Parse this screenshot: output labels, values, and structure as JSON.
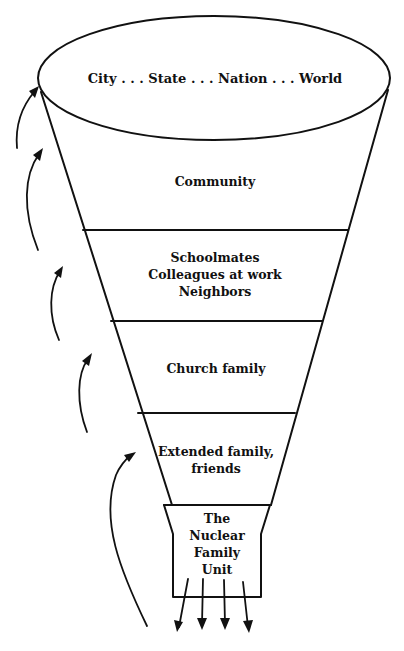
{
  "diagram": {
    "top_level": {
      "label": "City . . . State . . . Nation . . . World"
    },
    "levels": [
      {
        "id": "community",
        "lines": [
          "Community"
        ]
      },
      {
        "id": "schoolmates",
        "lines": [
          "Schoolmates",
          "Colleagues at work",
          "Neighbors"
        ]
      },
      {
        "id": "church",
        "lines": [
          "Church family"
        ]
      },
      {
        "id": "extended",
        "lines": [
          "Extended family,",
          "friends"
        ]
      },
      {
        "id": "nuclear",
        "lines": [
          "The",
          "Nuclear",
          "Family",
          "Unit"
        ]
      }
    ],
    "upward_arrows_count": 5,
    "outward_arrows_count": 4,
    "colors": {
      "ink": "#111111",
      "background": "#ffffff"
    }
  }
}
